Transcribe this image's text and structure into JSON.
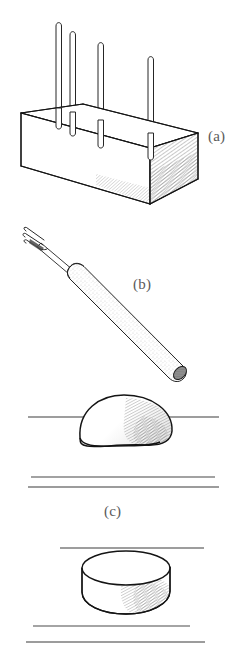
{
  "figure": {
    "background_color": "#ffffff",
    "ink_color": "#1a1a1a",
    "hatch_color": "#555555",
    "rule_color": "#4d4d4d",
    "label_color": "#5a5a5a",
    "panels": [
      {
        "id": "a",
        "label": "(a)",
        "label_x": 208,
        "label_y": 128,
        "subject": "rectangular-block-with-four-vertical-pins",
        "description": "Isometric rectangular block (brick) with four thin vertical rods standing upright on its top face; right end face is hatch-shaded.",
        "pin_count": 4,
        "pin_tops_y": [
          22,
          32,
          43,
          57
        ],
        "pin_x_positions": [
          58,
          72,
          100,
          150
        ]
      },
      {
        "id": "b",
        "label": "(b)",
        "label_x": 133,
        "label_y": 276,
        "subject": "small-fork-tool-with-textured-handle",
        "description": "Slender fork-tipped hand tool drawn diagonally; three-pronged tip at upper left, stippled cylindrical handle to lower right.",
        "prong_count": 3
      },
      {
        "id": "c",
        "label": "(c)",
        "label_x": 104,
        "label_y": 503,
        "subject": "dome-on-ruled-lines",
        "description": "Shaded dome (hemisphere) resting on a horizontal rule, with two further horizontal rules beneath it.",
        "rules_y": [
          417,
          477,
          487
        ]
      },
      {
        "id": "d",
        "label": "",
        "subject": "short-cylinder-disc-on-ruled-lines",
        "description": "Short cylindrical disc (puck) in isometric view between a rule above and two rules below; right side hatch-shaded.",
        "rules_y": [
          548,
          626,
          642
        ]
      }
    ]
  }
}
